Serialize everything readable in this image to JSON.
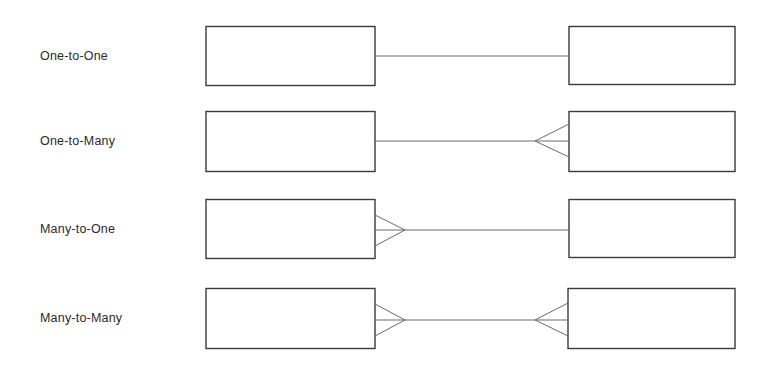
{
  "diagram": {
    "type": "entity-relationship-cardinality",
    "notation": "crow's foot",
    "colors": {
      "stroke": "#3a3a3a",
      "connector": "#6a6a6a",
      "text": "#2a2a2a",
      "background": "#ffffff"
    },
    "rows": [
      {
        "label": "One-to-One",
        "left_end": "one",
        "right_end": "one"
      },
      {
        "label": "One-to-Many",
        "left_end": "one",
        "right_end": "many"
      },
      {
        "label": "Many-to-One",
        "left_end": "many",
        "right_end": "one"
      },
      {
        "label": "Many-to-Many",
        "left_end": "many",
        "right_end": "many"
      }
    ]
  }
}
